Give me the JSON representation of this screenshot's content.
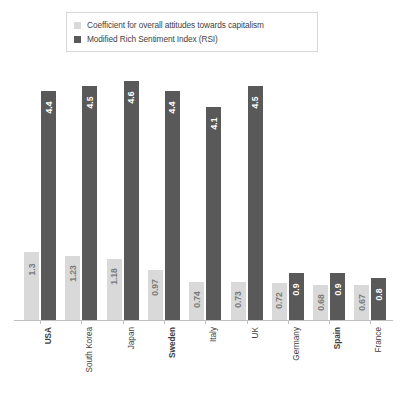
{
  "legend": {
    "items": [
      {
        "label": "Coefficient for overall attitudes towards capitalism",
        "swatch": "light",
        "color": "#d9d9d9"
      },
      {
        "label": "Modified Rich Sentiment Index (RSI)",
        "swatch": "dark",
        "color": "#595959"
      }
    ]
  },
  "chart_data": {
    "type": "bar",
    "title": "",
    "subtitle": "",
    "xlabel": "",
    "ylabel": "",
    "grid": false,
    "legend_position": "top",
    "ylim": [
      0,
      5.0
    ],
    "categories": [
      "USA",
      "South Korea",
      "Japan",
      "Sweden",
      "Italy",
      "UK",
      "Germany",
      "Spain",
      "France"
    ],
    "bold_categories": [
      "USA",
      "Sweden",
      "Spain"
    ],
    "series": [
      {
        "name": "Coefficient for overall attitudes towards capitalism",
        "color": "#d9d9d9",
        "values": [
          1.3,
          1.23,
          1.18,
          0.97,
          0.74,
          0.73,
          0.72,
          0.68,
          0.67
        ],
        "labels": [
          "1.3",
          "1.23",
          "1.18",
          "0.97",
          "0.74",
          "0.73",
          "0.72",
          "0.68",
          "0.67"
        ]
      },
      {
        "name": "Modified Rich Sentiment Index (RSI)",
        "color": "#595959",
        "values": [
          4.4,
          4.5,
          4.6,
          4.4,
          4.1,
          4.5,
          0.9,
          0.9,
          0.8
        ],
        "labels": [
          "4.4",
          "4.5",
          "4.6",
          "4.4",
          "4.1",
          "4.5",
          "0.9",
          "0.9",
          "0.8"
        ]
      }
    ]
  },
  "colors": {
    "light_series": "#d9d9d9",
    "dark_series": "#595959",
    "axis": "#bfbfbf",
    "text": "#3f3f3f",
    "background": "#ffffff"
  }
}
